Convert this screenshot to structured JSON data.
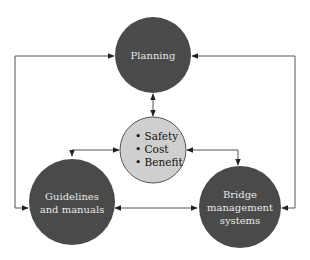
{
  "diagram": {
    "colors": {
      "outer_node_fill": "#4a4a4a",
      "center_node_fill": "#cfcfcf",
      "center_node_stroke": "#555555",
      "connector": "#222222"
    },
    "nodes": {
      "planning": {
        "label": "Planning"
      },
      "center": {
        "items": [
          "• Safety",
          "• Cost",
          "• Benefit"
        ]
      },
      "guidelines": {
        "lines": [
          "Guidelines",
          "and manuals"
        ]
      },
      "bridge": {
        "lines": [
          "Bridge",
          "management",
          "systems"
        ]
      }
    },
    "edges": [
      {
        "from": "planning",
        "to": "center",
        "type": "bidirectional"
      },
      {
        "from": "center",
        "to": "guidelines",
        "type": "bidirectional"
      },
      {
        "from": "center",
        "to": "bridge",
        "type": "bidirectional"
      },
      {
        "from": "guidelines",
        "to": "bridge",
        "type": "bidirectional"
      },
      {
        "from": "planning",
        "to": "guidelines",
        "type": "bidirectional",
        "route": "left-outer"
      },
      {
        "from": "planning",
        "to": "bridge",
        "type": "bidirectional",
        "route": "right-outer"
      }
    ]
  }
}
